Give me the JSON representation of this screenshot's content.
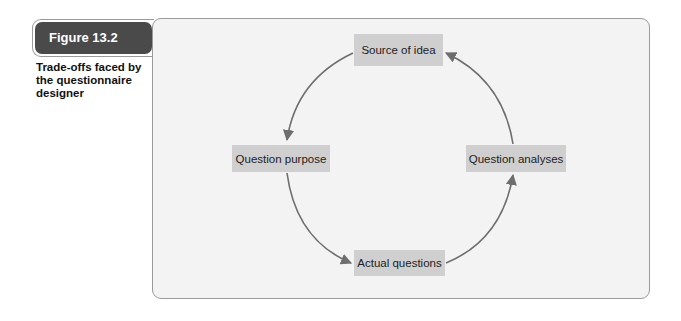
{
  "figure": {
    "label": "Figure 13.2",
    "caption": "Trade-offs faced by the questionnaire designer"
  },
  "diagram": {
    "type": "cycle",
    "direction": "counter-clockwise",
    "nodes": {
      "top": "Source of idea",
      "left": "Question purpose",
      "right": "Question analyses",
      "bottom": "Actual questions"
    },
    "edges": [
      {
        "from": "Source of idea",
        "to": "Question purpose"
      },
      {
        "from": "Question purpose",
        "to": "Actual questions"
      },
      {
        "from": "Actual questions",
        "to": "Question analyses"
      },
      {
        "from": "Question analyses",
        "to": "Source of idea"
      }
    ],
    "colors": {
      "node_fill": "#cfcfcf",
      "arrow": "#6e6e6e",
      "panel_bg": "#f3f3f3",
      "label_bg": "#4a4a4a"
    }
  }
}
